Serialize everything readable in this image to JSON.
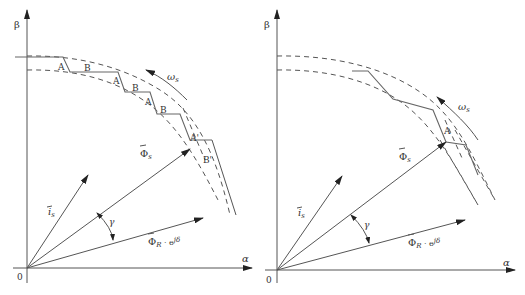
{
  "figure": {
    "panels": [
      {
        "id": "left",
        "axes": {
          "x_label": "α",
          "y_label": "β",
          "origin_label": "0"
        },
        "vectors": {
          "stator_current": "i_s",
          "stator_flux": "Φ_s",
          "rotor_flux": "Φ_R · e^{jδ}"
        },
        "angle_label": "γ",
        "rotation_label": "ω_s",
        "segment_labels": [
          "A",
          "B",
          "A",
          "B",
          "A",
          "B",
          "A'",
          "B'"
        ],
        "trajectory": "stepwise zigzag between flux hysteresis bands"
      },
      {
        "id": "right",
        "axes": {
          "x_label": "α",
          "y_label": "β",
          "origin_label": "0"
        },
        "vectors": {
          "stator_current": "i_s",
          "stator_flux": "Φ_s",
          "rotor_flux": "Φ_R · e^{jδ}"
        },
        "angle_label": "γ",
        "rotation_label": "ω_s",
        "segment_labels": [
          "A"
        ],
        "trajectory": "smoothed zigzag between flux hysteresis bands"
      }
    ]
  },
  "labels": {
    "beta": "β",
    "alpha": "α",
    "zero": "0",
    "gamma": "γ",
    "omega": "ω",
    "omega_sub": "s",
    "i": "i",
    "i_sub": "s",
    "phi": "Φ",
    "phi_s_sub": "s",
    "phi_r_sub": "R",
    "phi_r_tail": " · e",
    "phi_r_sup": "jδ",
    "A": "A",
    "B": "B",
    "A_prime": "A'",
    "B_prime": "B'"
  }
}
